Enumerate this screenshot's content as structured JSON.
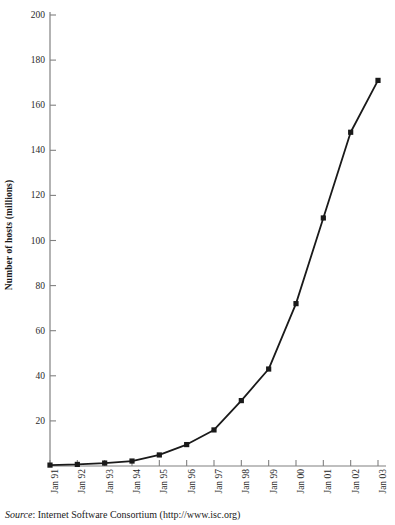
{
  "figure": {
    "y_axis_title": "Number of hosts (millions)",
    "source_prefix": "Source",
    "source_separator": ": ",
    "source_text": "Internet Software Consortium (http://www.isc.org)",
    "line_color": "#1a1a1a",
    "axis_color": "#808080",
    "marker_color": "#1a1a1a",
    "background_color": "#ffffff"
  },
  "chart_data": {
    "type": "line",
    "title": "",
    "xlabel": "",
    "ylabel": "Number of hosts (millions)",
    "categories": [
      "Jan 91",
      "Jan 92",
      "Jan 93",
      "Jan 94",
      "Jan 95",
      "Jan 96",
      "Jan 97",
      "Jan 98",
      "Jan 99",
      "Jan 00",
      "Jan 01",
      "Jan 02",
      "Jan 03"
    ],
    "values": [
      0.4,
      0.7,
      1.3,
      2.2,
      4.9,
      9.5,
      16,
      29,
      43,
      72,
      110,
      148,
      171
    ],
    "ylim": [
      0,
      200
    ],
    "ytick_values": [
      0,
      20,
      40,
      60,
      80,
      100,
      120,
      140,
      160,
      180,
      200
    ],
    "ytick_labels": [
      "",
      "20",
      "40",
      "60",
      "80",
      "100",
      "120",
      "140",
      "160",
      "180",
      "200"
    ],
    "grid": false,
    "legend": "none",
    "marker": "square",
    "annotations": []
  }
}
